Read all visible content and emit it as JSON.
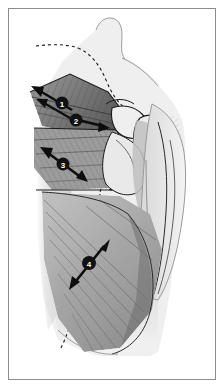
{
  "figure": {
    "view": "posterior",
    "side": "right",
    "background_color": "#ffffff",
    "border_color": "#8c8c8c",
    "ink_color": "#1a1a1a",
    "skin_fill": "#ececec",
    "muscle_fill": "#c9c9c9",
    "muscle_shadow": "#8f8f8f",
    "deep_shadow": "#4a4a4a"
  },
  "border": {
    "name": "figure-border",
    "inset_px": 8,
    "stroke_width": 1
  },
  "markers": [
    {
      "id": "marker-1",
      "label": "1",
      "x": 62,
      "y": 103,
      "radius": 6.5,
      "fill": "#111111",
      "text_color": "#ffffff",
      "arrow": {
        "type": "double-headed",
        "direction": "up-left",
        "from_x": 72,
        "from_y": 110,
        "to_x": 35,
        "to_y": 88
      },
      "region": "upper trapezius"
    },
    {
      "id": "marker-2",
      "label": "2",
      "x": 76,
      "y": 120,
      "radius": 6.5,
      "fill": "#111111",
      "text_color": "#ffffff",
      "arrow": {
        "type": "single-headed",
        "direction": "right-down",
        "from_x": 70,
        "from_y": 116,
        "to_x": 105,
        "to_y": 125
      },
      "region": "middle trapezius"
    },
    {
      "id": "marker-3",
      "label": "3",
      "x": 63,
      "y": 164,
      "radius": 6.5,
      "fill": "#111111",
      "text_color": "#ffffff",
      "arrow": {
        "type": "double-headed",
        "direction": "up-left-down-right",
        "from_x": 80,
        "from_y": 176,
        "to_x": 44,
        "to_y": 150
      },
      "region": "lower trapezius"
    },
    {
      "id": "marker-4",
      "label": "4",
      "x": 89,
      "y": 263,
      "radius": 7,
      "fill": "#111111",
      "text_color": "#ffffff",
      "arrow": {
        "type": "double-headed",
        "direction": "up-right-down-left",
        "from_x": 107,
        "from_y": 243,
        "to_x": 73,
        "to_y": 285
      },
      "region": "latissimus dorsi"
    }
  ],
  "anatomy_labels": {
    "neck": "neck",
    "trapezius": "trapezius",
    "scapula": "scapula",
    "acromion": "acromion",
    "humerus": "humerus",
    "upper_arm": "upper arm",
    "latissimus_dorsi": "latissimus dorsi",
    "deltoid": "deltoid"
  },
  "guides": {
    "midline_dashed": "vertical spinal midline dashed line",
    "scapular_dashed": "scapular border dashed outline",
    "dash_pattern": "3 3"
  }
}
